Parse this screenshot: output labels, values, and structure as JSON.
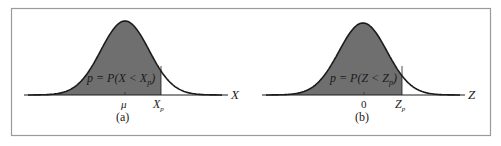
{
  "figure": {
    "frame_color": "#9a9a9a",
    "curve_color": "#1c1c1c",
    "fill_color": "#6f6f6f",
    "panels": [
      {
        "id": "a",
        "caption": "(a)",
        "area_label": "p = P(X < X",
        "area_label_sub": "p",
        "area_label_close": ")",
        "axis_label": "X",
        "center_tick_label": "μ",
        "cutoff_label": "X",
        "cutoff_label_sub": "p"
      },
      {
        "id": "b",
        "caption": "(b)",
        "area_label": "p = P(Z < Z",
        "area_label_sub": "p",
        "area_label_close": ")",
        "axis_label": "Z",
        "center_tick_label": "0",
        "cutoff_label": "Z",
        "cutoff_label_sub": "p"
      }
    ]
  },
  "chart_data": [
    {
      "type": "area",
      "title": "(a)",
      "description": "Normal distribution curve with area left of X_p shaded",
      "xlabel": "X",
      "x_ticks": [
        "μ",
        "X_p"
      ],
      "shaded_region": "x < X_p",
      "annotation": "p = P(X < X_p)"
    },
    {
      "type": "area",
      "title": "(b)",
      "description": "Standard normal curve with area left of Z_p shaded",
      "xlabel": "Z",
      "x_ticks": [
        "0",
        "Z_p"
      ],
      "shaded_region": "z < Z_p",
      "annotation": "p = P(Z < Z_p)"
    }
  ]
}
